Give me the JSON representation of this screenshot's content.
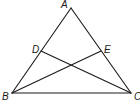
{
  "diagram": {
    "type": "geometry-triangle",
    "points": {
      "A": {
        "label": "A",
        "x": 71,
        "y": 8,
        "label_x": 61,
        "label_y": 8
      },
      "B": {
        "label": "B",
        "x": 12,
        "y": 93,
        "label_x": 2,
        "label_y": 100
      },
      "C": {
        "label": "C",
        "x": 131,
        "y": 93,
        "label_x": 134,
        "label_y": 100
      },
      "D": {
        "label": "D",
        "x": 41,
        "y": 51,
        "label_x": 32,
        "label_y": 53
      },
      "E": {
        "label": "E",
        "x": 101,
        "y": 51,
        "label_x": 104,
        "label_y": 53
      }
    },
    "segments": [
      {
        "name": "AB",
        "from": "A",
        "to": "B"
      },
      {
        "name": "AC",
        "from": "A",
        "to": "C"
      },
      {
        "name": "BC",
        "from": "B",
        "to": "C"
      },
      {
        "name": "DC",
        "from": "D",
        "to": "C"
      },
      {
        "name": "EB",
        "from": "E",
        "to": "B"
      }
    ],
    "colors": {
      "line": "#1a1a1a",
      "background": "#ffffff"
    }
  }
}
